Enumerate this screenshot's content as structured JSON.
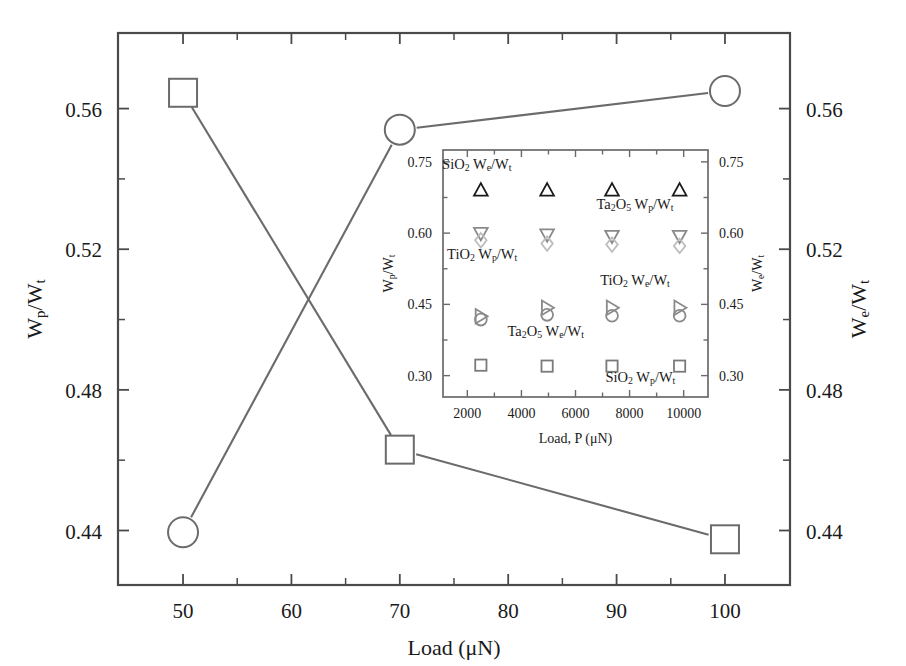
{
  "figure": {
    "background_color": "#ffffff",
    "line_color": "#6b6b6b",
    "axis_color": "#4a4a4a"
  },
  "main": {
    "x_axis": {
      "title": "Load (μN)",
      "ticks": [
        "50",
        "60",
        "70",
        "80",
        "90",
        "100"
      ],
      "tick_values": [
        50,
        60,
        70,
        80,
        90,
        100
      ],
      "min": 44,
      "max": 106
    },
    "y_axis_left": {
      "title_prefix": "W",
      "title_sub": "p",
      "title_suffix": "/W",
      "title_sub2": "t",
      "title_plain": "Wp/Wt",
      "ticks": [
        "0.44",
        "0.48",
        "0.52",
        "0.56"
      ],
      "tick_values": [
        0.44,
        0.48,
        0.52,
        0.56
      ],
      "min": 0.4245,
      "max": 0.5815
    },
    "y_axis_right": {
      "title_prefix": "W",
      "title_sub": "e",
      "title_suffix": "/W",
      "title_sub2": "t",
      "title_plain": "We/Wt",
      "ticks": [
        "0.44",
        "0.48",
        "0.52",
        "0.56"
      ],
      "tick_values": [
        0.44,
        0.48,
        0.52,
        0.56
      ],
      "min": 0.4245,
      "max": 0.5815
    }
  },
  "inset": {
    "x_axis": {
      "title": "Load, P (μN)",
      "ticks": [
        "2000",
        "4000",
        "6000",
        "8000",
        "10000"
      ],
      "tick_values": [
        2000,
        4000,
        6000,
        8000,
        10000
      ],
      "min": 1100,
      "max": 10900
    },
    "y_axis_left": {
      "title_plain": "Wp/Wt",
      "ticks": [
        "0.30",
        "0.45",
        "0.60",
        "0.75"
      ],
      "tick_values": [
        0.3,
        0.45,
        0.6,
        0.75
      ],
      "min": 0.255,
      "max": 0.775
    },
    "y_axis_right": {
      "title_plain": "We/Wt",
      "ticks": [
        "0.30",
        "0.45",
        "0.60",
        "0.75"
      ],
      "tick_values": [
        0.3,
        0.45,
        0.6,
        0.75
      ],
      "min": 0.255,
      "max": 0.775
    },
    "series_labels": [
      {
        "id": "sio2-we-label",
        "text_parts": [
          "SiO",
          "2",
          " W",
          "e",
          "/W",
          "t"
        ],
        "plain": "SiO2 We/Wt",
        "x": 2350,
        "y": 0.735
      },
      {
        "id": "ta2o5-wp-label",
        "text_parts": [
          "Ta",
          "2",
          "O",
          "5",
          " W",
          "p",
          "/W",
          "t"
        ],
        "plain": "Ta2O5 Wp/Wt",
        "x": 8200,
        "y": 0.651
      },
      {
        "id": "tio2-wp-label",
        "text_parts": [
          "TiO",
          "2",
          " W",
          "p",
          "/W",
          "t"
        ],
        "plain": "TiO2 Wp/Wt",
        "x": 2550,
        "y": 0.546
      },
      {
        "id": "tio2-we-label",
        "text_parts": [
          "TiO",
          "2",
          " W",
          "e",
          "/W",
          "t"
        ],
        "plain": "TiO2 We/Wt",
        "x": 8200,
        "y": 0.49
      },
      {
        "id": "ta2o5-we-label",
        "text_parts": [
          "Ta",
          "2",
          "O",
          "5",
          " W",
          "e",
          "/W",
          "t"
        ],
        "plain": "Ta2O5 We/Wt",
        "x": 4900,
        "y": 0.383
      },
      {
        "id": "sio2-wp-label",
        "text_parts": [
          "SiO",
          "2",
          " W",
          "p",
          "/W",
          "t"
        ],
        "plain": "SiO2 Wp/Wt",
        "x": 8400,
        "y": 0.287
      }
    ]
  },
  "chart_data": [
    {
      "type": "scatter",
      "id": "main-plot",
      "title": "",
      "xlabel": "Load (μN)",
      "ylabel": "Wp/Wt",
      "ylabel_right": "We/Wt",
      "xlim": [
        44,
        106
      ],
      "ylim": [
        0.4245,
        0.5815
      ],
      "grid": false,
      "legend": "none",
      "x": [
        50,
        70,
        100
      ],
      "series": [
        {
          "name": "Wp/Wt",
          "marker": "square",
          "axis": "left",
          "values": [
            0.5645,
            0.463,
            0.4375
          ]
        },
        {
          "name": "We/Wt",
          "marker": "circle",
          "axis": "right",
          "values": [
            0.4395,
            0.554,
            0.565
          ]
        }
      ]
    },
    {
      "type": "scatter",
      "id": "inset-plot",
      "title": "",
      "xlabel": "Load, P (μN)",
      "ylabel": "Wp/Wt",
      "ylabel_right": "We/Wt",
      "xlim": [
        1100,
        10900
      ],
      "ylim": [
        0.255,
        0.775
      ],
      "grid": false,
      "legend": "inline-annotations",
      "x": [
        2500,
        4950,
        7350,
        9850
      ],
      "series": [
        {
          "name": "SiO2 We/Wt",
          "marker": "triangle-up",
          "color": "#1a1a1a",
          "axis": "right",
          "values": [
            0.69,
            0.69,
            0.69,
            0.69
          ]
        },
        {
          "name": "Ta2O5 Wp/Wt",
          "marker": "triangle-down",
          "color": "#8a8a8a",
          "axis": "left",
          "values": [
            0.6,
            0.597,
            0.594,
            0.594
          ]
        },
        {
          "name": "TiO2 Wp/Wt",
          "marker": "diamond",
          "color": "#bdbdbd",
          "axis": "left",
          "values": [
            0.585,
            0.578,
            0.576,
            0.573
          ]
        },
        {
          "name": "TiO2 We/Wt",
          "marker": "triangle-right",
          "color": "#8a8a8a",
          "axis": "right",
          "values": [
            0.425,
            0.443,
            0.443,
            0.443
          ]
        },
        {
          "name": "Ta2O5 We/Wt",
          "marker": "circle",
          "color": "#8a8a8a",
          "axis": "right",
          "values": [
            0.418,
            0.428,
            0.426,
            0.426
          ]
        },
        {
          "name": "SiO2 Wp/Wt",
          "marker": "square",
          "color": "#7a7a7a",
          "axis": "left",
          "values": [
            0.322,
            0.32,
            0.32,
            0.32
          ]
        }
      ]
    }
  ]
}
